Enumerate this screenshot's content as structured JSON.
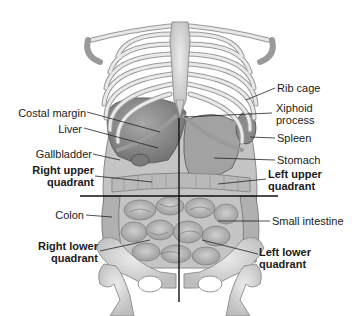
{
  "diagram": {
    "labels": {
      "rib_cage": "Rib cage",
      "xiphoid_line1": "Xiphoid",
      "xiphoid_line2": "process",
      "costal_margin": "Costal margin",
      "liver": "Liver",
      "spleen": "Spleen",
      "gallbladder": "Gallbladder",
      "stomach": "Stomach",
      "ruq_line1": "Right upper",
      "ruq_line2": "quadrant",
      "luq_line1": "Left upper",
      "luq_line2": "quadrant",
      "colon": "Colon",
      "small_intestine": "Small intestine",
      "rlq_line1": "Right lower",
      "rlq_line2": "quadrant",
      "llq_line1": "Left lower",
      "llq_line2": "quadrant"
    },
    "colors": {
      "bone": "#d9d9d9",
      "bone_edge": "#8a8a8a",
      "organ": "#9c9c9c",
      "organ_dark": "#6e6e6e",
      "intestine": "#b5b5b5",
      "line": "#111111"
    }
  }
}
